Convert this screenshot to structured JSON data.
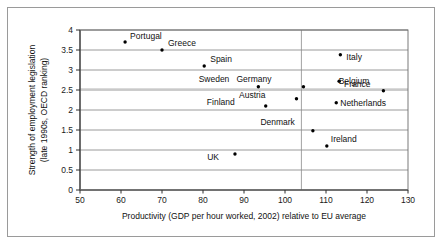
{
  "chart_data": {
    "type": "scatter",
    "title": "",
    "xlabel": "Productivity (GDP per hour worked, 2002) relative to EU average",
    "ylabel_line1": "Strength of employment legislation",
    "ylabel_line2": "(late 1990s, OECD ranking)",
    "xlim": [
      50,
      130
    ],
    "ylim": [
      0,
      4
    ],
    "xticks": [
      "50",
      "60",
      "70",
      "80",
      "90",
      "100",
      "110",
      "120",
      "130"
    ],
    "xtick_values": [
      50,
      60,
      70,
      80,
      90,
      100,
      110,
      120,
      130
    ],
    "yticks": [
      "0",
      "0.5",
      "1",
      "1.5",
      "2",
      "2.5",
      "3",
      "3.5",
      "4"
    ],
    "ytick_values": [
      0,
      0.5,
      1,
      1.5,
      2,
      2.5,
      3,
      3.5,
      4
    ],
    "grid": "horizontal",
    "legend": "none",
    "reference_line_x": 104,
    "reference_line_y": 2.53,
    "marker_color": "#000000",
    "grid_color": "#808080",
    "axis_color": "#404040",
    "points": [
      {
        "label": "Portugal",
        "x": 61.0,
        "y": 3.7,
        "label_dx": 5,
        "label_dy": -3
      },
      {
        "label": "Greece",
        "x": 70.0,
        "y": 3.5,
        "label_dx": 6,
        "label_dy": -4
      },
      {
        "label": "Spain",
        "x": 80.3,
        "y": 3.1,
        "label_dx": 6,
        "label_dy": -4
      },
      {
        "label": "Italy",
        "x": 113.5,
        "y": 3.38,
        "label_dx": 6,
        "label_dy": 5
      },
      {
        "label": "Sweden",
        "x": 93.5,
        "y": 2.58,
        "label_dx": -29,
        "label_dy": -5
      },
      {
        "label": "Germany",
        "x": 104.5,
        "y": 2.58,
        "label_dx": -32,
        "label_dy": -5
      },
      {
        "label": "France",
        "x": 113.2,
        "y": 2.72,
        "label_dx": 5,
        "label_dy": 6
      },
      {
        "label": "Belgium",
        "x": 124.0,
        "y": 2.48,
        "label_dx": -14,
        "label_dy": -7
      },
      {
        "label": "Austria",
        "x": 102.8,
        "y": 2.28,
        "label_dx": -31,
        "label_dy": -1
      },
      {
        "label": "Finland",
        "x": 95.3,
        "y": 2.1,
        "label_dx": -31,
        "label_dy": -1
      },
      {
        "label": "Netherlands",
        "x": 112.5,
        "y": 2.18,
        "label_dx": 4,
        "label_dy": 3
      },
      {
        "label": "Denmark",
        "x": 106.8,
        "y": 1.48,
        "label_dx": -18,
        "label_dy": -6
      },
      {
        "label": "Ireland",
        "x": 110.2,
        "y": 1.1,
        "label_dx": 4,
        "label_dy": -4
      },
      {
        "label": "UK",
        "x": 87.8,
        "y": 0.9,
        "label_dx": -16,
        "label_dy": 6
      }
    ]
  }
}
